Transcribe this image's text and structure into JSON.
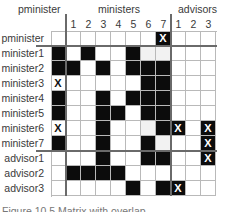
{
  "headers": {
    "pminister_group": "pminister",
    "ministers_group": "ministers",
    "advisors_group": "advisors"
  },
  "columns": [
    "",
    "1",
    "2",
    "3",
    "4",
    "5",
    "6",
    "7",
    "1",
    "2",
    "3"
  ],
  "rows": [
    {
      "label": "pminister",
      "cells": [
        "w",
        "w",
        "w",
        "w",
        "w",
        "w",
        "w",
        "xb",
        "w",
        "w",
        "w"
      ]
    },
    {
      "label": "minister1",
      "cells": [
        "b",
        "w",
        "b",
        "w",
        "w",
        "b",
        "l",
        "l",
        "w",
        "w",
        "w"
      ]
    },
    {
      "label": "minister2",
      "cells": [
        "b",
        "b",
        "w",
        "b",
        "w",
        "b",
        "b",
        "b",
        "w",
        "w",
        "w"
      ]
    },
    {
      "label": "minister3",
      "cells": [
        "xw",
        "w",
        "w",
        "w",
        "w",
        "w",
        "b",
        "b",
        "w",
        "w",
        "w"
      ]
    },
    {
      "label": "minister4",
      "cells": [
        "b",
        "w",
        "w",
        "b",
        "w",
        "b",
        "b",
        "b",
        "w",
        "w",
        "w"
      ]
    },
    {
      "label": "minister5",
      "cells": [
        "b",
        "w",
        "w",
        "b",
        "b",
        "w",
        "b",
        "b",
        "w",
        "w",
        "w"
      ]
    },
    {
      "label": "minister6",
      "cells": [
        "xw",
        "w",
        "w",
        "b",
        "w",
        "w",
        "l",
        "b",
        "xb",
        "w",
        "xb"
      ]
    },
    {
      "label": "minister7",
      "cells": [
        "b",
        "w",
        "w",
        "b",
        "w",
        "w",
        "b",
        "l",
        "w",
        "w",
        "xb"
      ]
    },
    {
      "label": "advisor1",
      "cells": [
        "w",
        "w",
        "w",
        "b",
        "w",
        "w",
        "b",
        "b",
        "w",
        "w",
        "xb"
      ]
    },
    {
      "label": "advisor2",
      "cells": [
        "w",
        "b",
        "b",
        "b",
        "b",
        "w",
        "w",
        "w",
        "w",
        "w",
        "w"
      ]
    },
    {
      "label": "advisor3",
      "cells": [
        "w",
        "w",
        "w",
        "w",
        "w",
        "b",
        "w",
        "b",
        "xb",
        "w",
        "w"
      ]
    }
  ],
  "mark_symbol": "X",
  "caption": "Figure 10.5  Matrix with overlap",
  "colors": {
    "filled": "#0c0c0c",
    "empty": "#ffffff",
    "light": "#f2f2f2",
    "gridline": "#b9b9b9",
    "separator": "#6a6a6a"
  }
}
